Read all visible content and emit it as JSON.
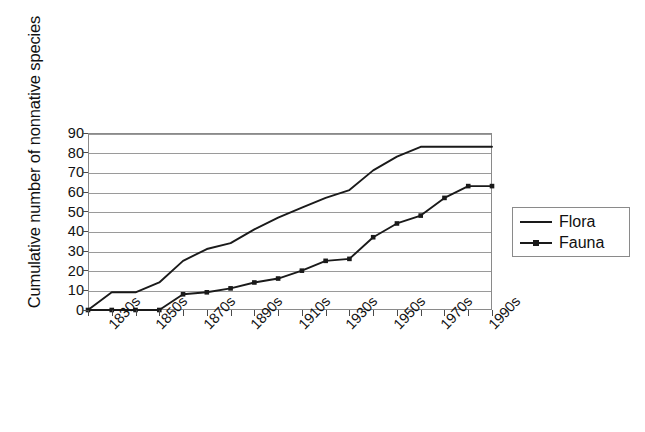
{
  "chart_data": {
    "type": "line",
    "title": "",
    "xlabel": "",
    "ylabel": "Cumulative number of nonnative species",
    "ylim": [
      0,
      90
    ],
    "ytick_step": 10,
    "yticks": [
      0,
      10,
      20,
      30,
      40,
      50,
      60,
      70,
      80,
      90
    ],
    "grid": "horizontal",
    "legend_position": "right",
    "categories": [
      "1820s",
      "1830s",
      "1840s",
      "1850s",
      "1860s",
      "1870s",
      "1880s",
      "1890s",
      "1900s",
      "1910s",
      "1920s",
      "1930s",
      "1940s",
      "1950s",
      "1960s",
      "1970s",
      "1980s",
      "1990s"
    ],
    "xtick_labels_shown": [
      "1830s",
      "1850s",
      "1870s",
      "1890s",
      "1910s",
      "1930s",
      "1950s",
      "1970s",
      "1990s"
    ],
    "series": [
      {
        "name": "Flora",
        "marker": "none",
        "color": "#1a1a1a",
        "values": [
          0,
          9,
          9,
          14,
          25,
          31,
          34,
          41,
          47,
          52,
          57,
          61,
          71,
          78,
          83,
          83,
          83,
          83
        ]
      },
      {
        "name": "Fauna",
        "marker": "square",
        "color": "#1a1a1a",
        "values": [
          0,
          0,
          0,
          0,
          8,
          9,
          11,
          14,
          16,
          20,
          25,
          26,
          37,
          44,
          48,
          57,
          63,
          63
        ]
      }
    ]
  },
  "axes": {
    "y_title": "Cumulative number of nonnative species"
  },
  "legend": {
    "entries": [
      {
        "label": "Flora",
        "marker": "none"
      },
      {
        "label": "Fauna",
        "marker": "square"
      }
    ]
  },
  "colors": {
    "line": "#1a1a1a",
    "grid": "#9a9a9a",
    "frame": "#8a8a8a",
    "text": "#111111",
    "background": "#ffffff"
  }
}
